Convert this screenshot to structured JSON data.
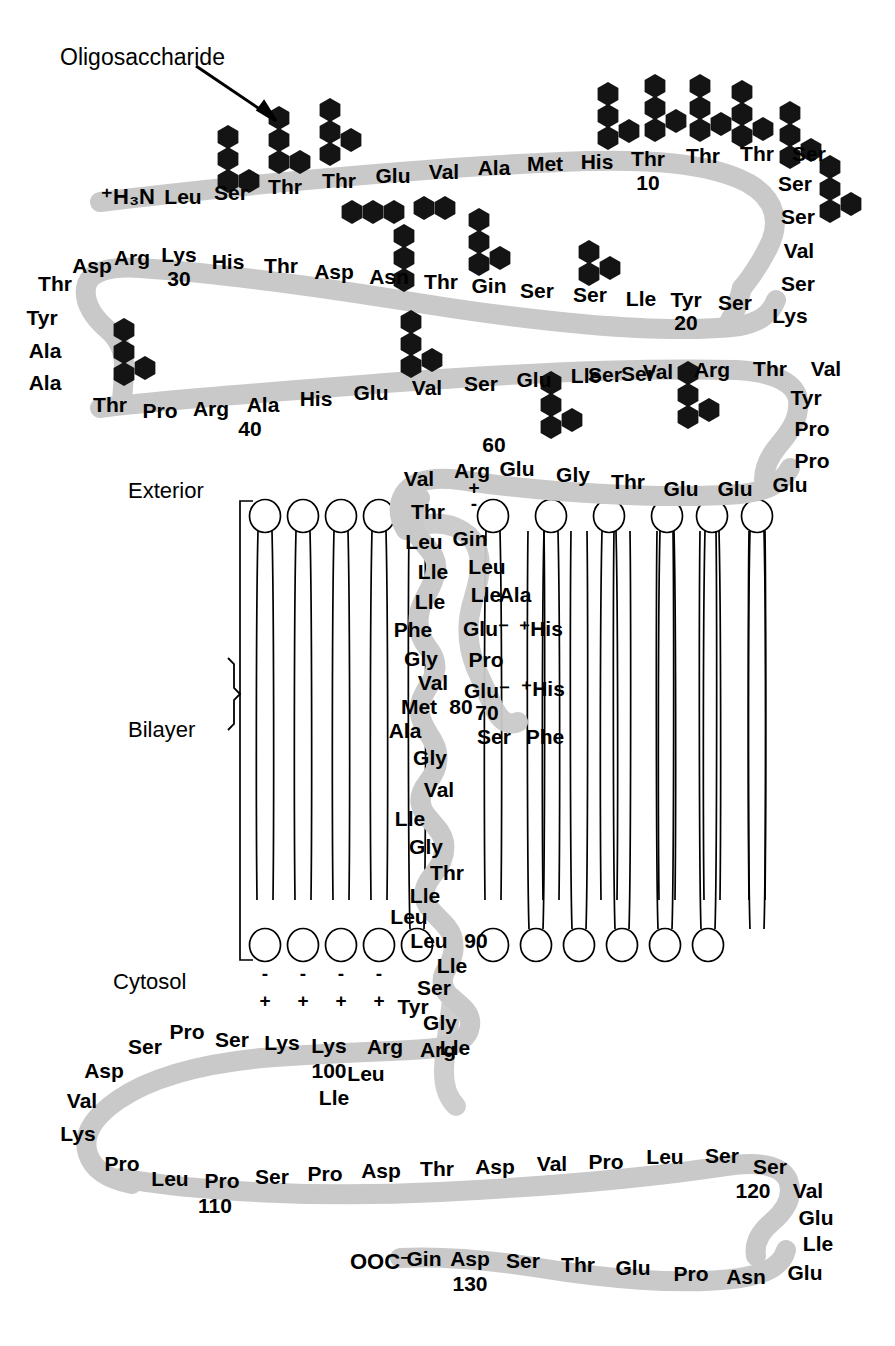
{
  "figure": {
    "callout_label": "Oligosaccharide",
    "ribbon_color": "#c9c9c9",
    "glycan_color": "#1a1a1a",
    "lipid_color": "#000000",
    "text_color": "#000000"
  },
  "compartments": {
    "exterior": "Exterior",
    "bilayer": "Bilayer",
    "cytosol": "Cytosol"
  },
  "termini": {
    "n_terminus": "⁺H₃N",
    "c_terminus": "OOC⁻"
  },
  "position_numbers": [
    "10",
    "20",
    "30",
    "40",
    "60",
    "70",
    "80",
    "90",
    "100",
    "110",
    "120",
    "130"
  ],
  "charge_marks": {
    "backbone_plus": "+",
    "backbone_minus": "-",
    "lipid_minus": "-",
    "lipid_plus": "+"
  },
  "segments": {
    "row1": {
      "name": "n-terminal-row",
      "residues": [
        "Leu",
        "Ser",
        "Thr",
        "Thr",
        "Glu",
        "Val",
        "Ala",
        "Met",
        "His",
        "Thr",
        "Thr",
        "Thr",
        "Ser"
      ],
      "number_at": "10"
    },
    "right_turn_1": {
      "name": "right-turn-upper",
      "residues": [
        "Ser",
        "Ser",
        "Val",
        "Ser",
        "Lys"
      ]
    },
    "row2": {
      "name": "row-two",
      "residues": [
        "Ser",
        "Tyr",
        "Lle",
        "Ser",
        "Ser",
        "Gin",
        "Thr",
        "Asn",
        "Asp",
        "Thr",
        "His",
        "Lys",
        "Arg",
        "Asp",
        "Thr"
      ],
      "number_at": "20",
      "number_at_2": "30"
    },
    "left_turn_1": {
      "name": "left-turn-upper",
      "residues": [
        "Thr",
        "Tyr",
        "Ala",
        "Ala",
        "Thr"
      ]
    },
    "row3": {
      "name": "row-three",
      "residues": [
        "Thr",
        "Pro",
        "Arg",
        "Ala",
        "His",
        "Glu",
        "Val",
        "Ser",
        "Glu",
        "Lle",
        "Ser",
        "Val",
        "Arg",
        "Thr",
        "Val"
      ],
      "number_at": "40"
    },
    "right_turn_2": {
      "name": "right-turn-lower",
      "residues": [
        "Tyr",
        "Pro",
        "Pro",
        "Glu"
      ]
    },
    "row4": {
      "name": "row-four-juxtamembrane",
      "residues": [
        "Val",
        "Arg",
        "Glu",
        "Gly",
        "Thr",
        "Glu",
        "Glu"
      ],
      "number_at": "60"
    },
    "tm_descend": {
      "name": "tm-helix-descending-first-pass",
      "residues": [
        "Thr",
        "Leu",
        "Lle",
        "Lle",
        "Phe",
        "Gly",
        "Val",
        "Met",
        "Ala"
      ],
      "number_at": "80"
    },
    "tm_loop_right": {
      "name": "tm-loop-right",
      "residues": [
        "Gin",
        "Leu",
        "Lle",
        "Ala",
        "Glu⁻",
        "⁺His",
        "Pro",
        "Glu⁻",
        "⁺His",
        "Ser",
        "Phe"
      ],
      "number_at": "70"
    },
    "tm_helix": {
      "name": "tm-helix-core",
      "residues": [
        "Gly",
        "Val",
        "Lle",
        "Gly",
        "Thr",
        "Lle",
        "Leu",
        "Leu",
        "Lle",
        "Ser",
        "Tyr",
        "Gly",
        "Lle"
      ],
      "number_at": "90"
    },
    "cyto_basic": {
      "name": "cytosolic-basic-cluster",
      "residues": [
        "Arg",
        "Arg",
        "Lle",
        "Leu",
        "Lys",
        "Lys",
        "Ser",
        "Pro",
        "Ser",
        "Asp",
        "Val",
        "Lys"
      ],
      "number_at": "100"
    },
    "row5": {
      "name": "cytosolic-row-five",
      "residues": [
        "Pro",
        "Leu",
        "Pro",
        "Ser",
        "Pro",
        "Asp",
        "Thr",
        "Asp",
        "Val",
        "Pro",
        "Leu",
        "Ser",
        "Ser"
      ],
      "number_at": "110",
      "number_at_2": "120"
    },
    "right_turn_3": {
      "name": "right-turn-cytosolic",
      "residues": [
        "Val",
        "Glu",
        "Lle",
        "Glu"
      ]
    },
    "row6": {
      "name": "c-terminal-row",
      "residues": [
        "Asn",
        "Pro",
        "Glu",
        "Thr",
        "Ser",
        "Asp",
        "Gin"
      ],
      "number_at": "130"
    }
  },
  "glycans": {
    "o_linked_count": 15,
    "n_linked_count": 1,
    "n_linked_site": "Asn",
    "note_shape": "hexagon-sugar-units"
  },
  "lipids": {
    "outer_leaflet_left": 4,
    "outer_leaflet_right": 6,
    "inner_leaflet_left": 5,
    "inner_leaflet_right": 6,
    "charge_pairs": 4
  }
}
